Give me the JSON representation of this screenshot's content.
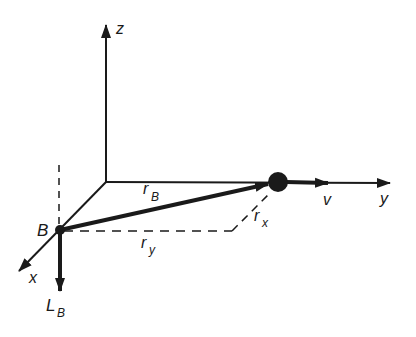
{
  "diagram": {
    "type": "3d-vector-diagram",
    "axes": {
      "z": {
        "label": "z"
      },
      "y": {
        "label": "y"
      },
      "x": {
        "label": "x"
      }
    },
    "points": {
      "B": {
        "label": "B"
      }
    },
    "vectors": {
      "r_B": {
        "main": "r",
        "sub": "B"
      },
      "v": {
        "label": "v"
      },
      "L_B": {
        "main": "L",
        "sub": "B"
      }
    },
    "components": {
      "r_x": {
        "main": "r",
        "sub": "x"
      },
      "r_y": {
        "main": "r",
        "sub": "y"
      }
    },
    "colors": {
      "ink": "#1a1a1a",
      "background": "#ffffff"
    }
  }
}
